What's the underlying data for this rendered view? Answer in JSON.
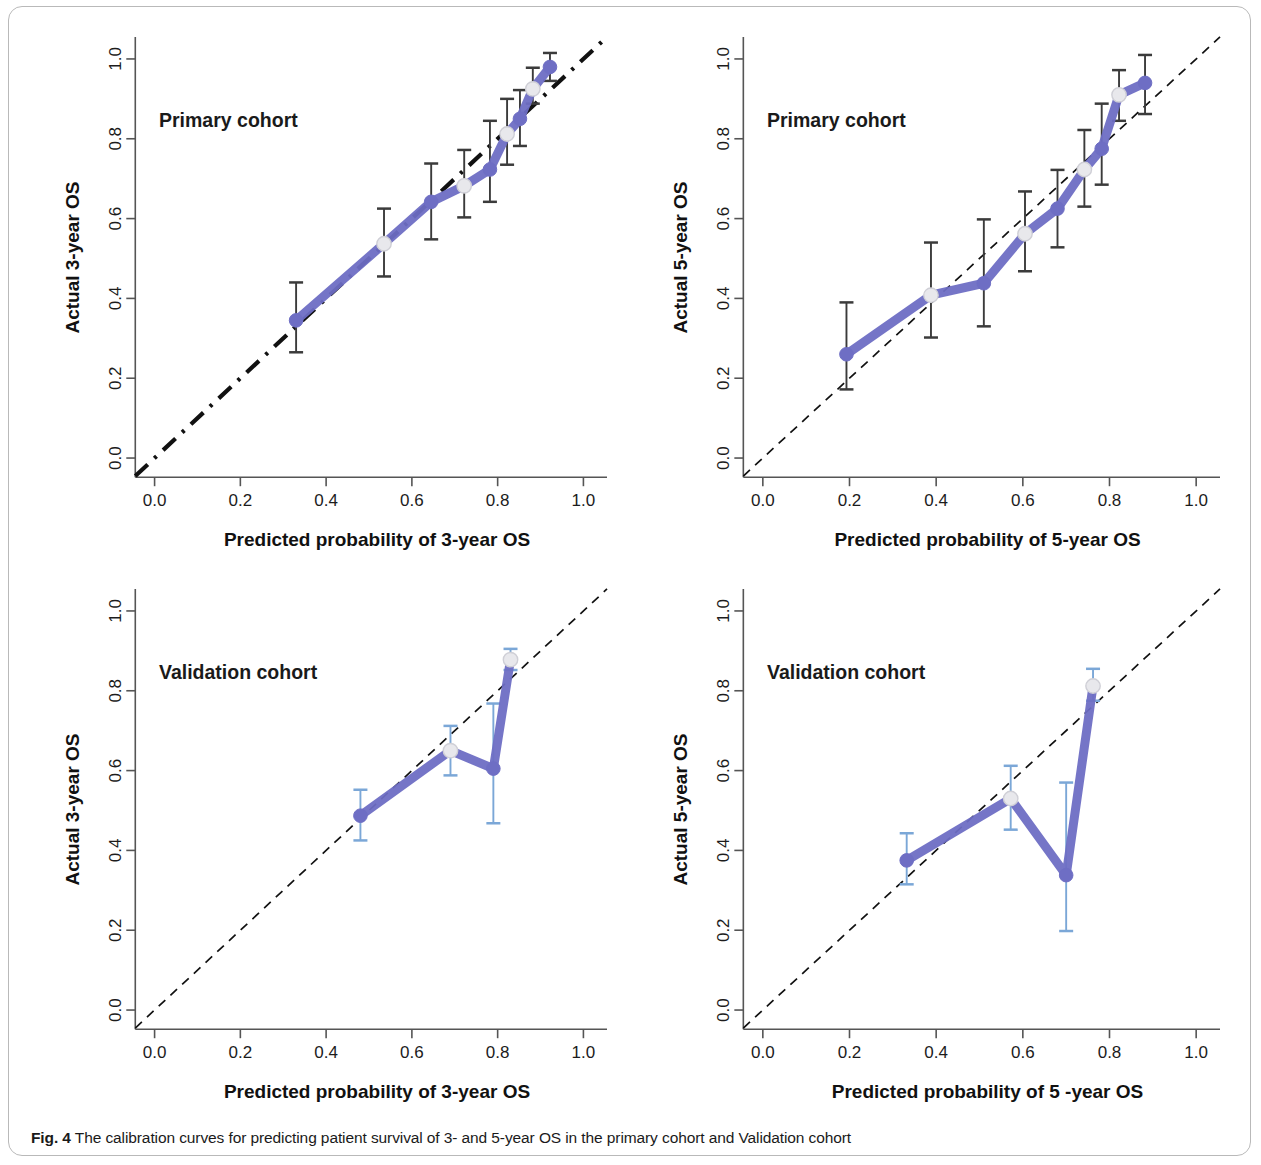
{
  "figure": {
    "caption_label": "Fig. 4",
    "caption_text": " The calibration curves for predicting patient survival of 3- and 5-year OS in the primary cohort and Validation cohort",
    "colors": {
      "curve_purple": "#6e6ec4",
      "errorbar_dark": "#3b3b3b",
      "errorbar_light": "#7ba7d7",
      "reference_line": "#111111",
      "open_marker_fill": "#e8e8ec",
      "axis": "#555555",
      "frame": "#b9b9b9"
    }
  },
  "chart_data": [
    {
      "id": "primary-3yr",
      "type": "line",
      "title": "Primary cohort",
      "xlabel": "Predicted probability of 3-year OS",
      "ylabel": "Actual 3-year OS",
      "xlim": [
        0.0,
        1.0
      ],
      "ylim": [
        0.0,
        1.0
      ],
      "xticks": [
        "0.0",
        "0.2",
        "0.4",
        "0.6",
        "0.8",
        "1.0"
      ],
      "yticks": [
        "0.0",
        "0.2",
        "0.4",
        "0.6",
        "0.8",
        "1.0"
      ],
      "xtick_values": [
        0.0,
        0.2,
        0.4,
        0.6,
        0.8,
        1.0
      ],
      "ytick_values": [
        0.0,
        0.2,
        0.4,
        0.6,
        0.8,
        1.0
      ],
      "grid": false,
      "legend": "none",
      "reference_line": {
        "style": "dash-dot",
        "width": "thick",
        "from": [
          0.0,
          0.0
        ],
        "to": [
          1.0,
          1.0
        ]
      },
      "errorbar_color": "dark",
      "points": [
        {
          "x": 0.33,
          "y": 0.345,
          "lo": 0.265,
          "hi": 0.44,
          "marker": "filled"
        },
        {
          "x": 0.535,
          "y": 0.537,
          "lo": 0.455,
          "hi": 0.625,
          "marker": "open"
        },
        {
          "x": 0.645,
          "y": 0.642,
          "lo": 0.548,
          "hi": 0.738,
          "marker": "filled"
        },
        {
          "x": 0.722,
          "y": 0.682,
          "lo": 0.603,
          "hi": 0.772,
          "marker": "open"
        },
        {
          "x": 0.782,
          "y": 0.723,
          "lo": 0.642,
          "hi": 0.845,
          "marker": "filled"
        },
        {
          "x": 0.822,
          "y": 0.812,
          "lo": 0.735,
          "hi": 0.9,
          "marker": "open"
        },
        {
          "x": 0.852,
          "y": 0.85,
          "lo": 0.782,
          "hi": 0.922,
          "marker": "filled"
        },
        {
          "x": 0.882,
          "y": 0.925,
          "lo": 0.888,
          "hi": 0.978,
          "marker": "open"
        },
        {
          "x": 0.922,
          "y": 0.98,
          "lo": 0.945,
          "hi": 1.015,
          "marker": "filled"
        }
      ]
    },
    {
      "id": "primary-5yr",
      "type": "line",
      "title": "Primary cohort",
      "xlabel": "Predicted probability of  5-year OS",
      "ylabel": "Actual 5-year OS",
      "xlim": [
        0.0,
        1.0
      ],
      "ylim": [
        0.0,
        1.0
      ],
      "xticks": [
        "0.0",
        "0.2",
        "0.4",
        "0.6",
        "0.8",
        "1.0"
      ],
      "yticks": [
        "0.0",
        "0.2",
        "0.4",
        "0.6",
        "0.8",
        "1.0"
      ],
      "xtick_values": [
        0.0,
        0.2,
        0.4,
        0.6,
        0.8,
        1.0
      ],
      "ytick_values": [
        0.0,
        0.2,
        0.4,
        0.6,
        0.8,
        1.0
      ],
      "grid": false,
      "legend": "none",
      "reference_line": {
        "style": "dash",
        "width": "thin",
        "from": [
          0.0,
          0.0
        ],
        "to": [
          1.0,
          1.0
        ]
      },
      "errorbar_color": "dark",
      "points": [
        {
          "x": 0.193,
          "y": 0.26,
          "lo": 0.172,
          "hi": 0.39,
          "marker": "filled"
        },
        {
          "x": 0.388,
          "y": 0.408,
          "lo": 0.302,
          "hi": 0.54,
          "marker": "open"
        },
        {
          "x": 0.51,
          "y": 0.438,
          "lo": 0.33,
          "hi": 0.598,
          "marker": "filled"
        },
        {
          "x": 0.605,
          "y": 0.562,
          "lo": 0.468,
          "hi": 0.668,
          "marker": "open"
        },
        {
          "x": 0.68,
          "y": 0.625,
          "lo": 0.528,
          "hi": 0.722,
          "marker": "filled"
        },
        {
          "x": 0.742,
          "y": 0.723,
          "lo": 0.63,
          "hi": 0.822,
          "marker": "open"
        },
        {
          "x": 0.782,
          "y": 0.775,
          "lo": 0.685,
          "hi": 0.888,
          "marker": "filled"
        },
        {
          "x": 0.822,
          "y": 0.91,
          "lo": 0.845,
          "hi": 0.972,
          "marker": "open"
        },
        {
          "x": 0.882,
          "y": 0.94,
          "lo": 0.862,
          "hi": 1.01,
          "marker": "filled"
        }
      ]
    },
    {
      "id": "validation-3yr",
      "type": "line",
      "title": "Validation cohort",
      "xlabel": "Predicted probability of 3-year OS",
      "ylabel": "Actual 3-year OS",
      "xlim": [
        0.0,
        1.0
      ],
      "ylim": [
        0.0,
        1.0
      ],
      "xticks": [
        "0.0",
        "0.2",
        "0.4",
        "0.6",
        "0.8",
        "1.0"
      ],
      "yticks": [
        "0.0",
        "0.2",
        "0.4",
        "0.6",
        "0.8",
        "1.0"
      ],
      "xtick_values": [
        0.0,
        0.2,
        0.4,
        0.6,
        0.8,
        1.0
      ],
      "ytick_values": [
        0.0,
        0.2,
        0.4,
        0.6,
        0.8,
        1.0
      ],
      "grid": false,
      "legend": "none",
      "reference_line": {
        "style": "dash",
        "width": "thin",
        "from": [
          0.0,
          0.0
        ],
        "to": [
          1.0,
          1.0
        ]
      },
      "errorbar_color": "light",
      "points": [
        {
          "x": 0.48,
          "y": 0.487,
          "lo": 0.425,
          "hi": 0.552,
          "marker": "filled"
        },
        {
          "x": 0.69,
          "y": 0.65,
          "lo": 0.588,
          "hi": 0.712,
          "marker": "open"
        },
        {
          "x": 0.79,
          "y": 0.605,
          "lo": 0.468,
          "hi": 0.768,
          "marker": "filled"
        },
        {
          "x": 0.83,
          "y": 0.878,
          "lo": 0.852,
          "hi": 0.905,
          "marker": "open"
        }
      ]
    },
    {
      "id": "validation-5yr",
      "type": "line",
      "title": "Validation cohort",
      "xlabel": "Predicted probability of 5 -year OS",
      "ylabel": "Actual 5-year OS",
      "xlim": [
        0.0,
        1.0
      ],
      "ylim": [
        0.0,
        1.0
      ],
      "xticks": [
        "0.0",
        "0.2",
        "0.4",
        "0.6",
        "0.8",
        "1.0"
      ],
      "yticks": [
        "0.0",
        "0.2",
        "0.4",
        "0.6",
        "0.8",
        "1.0"
      ],
      "xtick_values": [
        0.0,
        0.2,
        0.4,
        0.6,
        0.8,
        1.0
      ],
      "ytick_values": [
        0.0,
        0.2,
        0.4,
        0.6,
        0.8,
        1.0
      ],
      "grid": false,
      "legend": "none",
      "reference_line": {
        "style": "dash",
        "width": "thin",
        "from": [
          0.0,
          0.0
        ],
        "to": [
          1.0,
          1.0
        ]
      },
      "errorbar_color": "light",
      "points": [
        {
          "x": 0.332,
          "y": 0.375,
          "lo": 0.315,
          "hi": 0.443,
          "marker": "filled"
        },
        {
          "x": 0.572,
          "y": 0.53,
          "lo": 0.452,
          "hi": 0.612,
          "marker": "open"
        },
        {
          "x": 0.7,
          "y": 0.338,
          "lo": 0.198,
          "hi": 0.57,
          "marker": "filled"
        },
        {
          "x": 0.762,
          "y": 0.812,
          "lo": 0.775,
          "hi": 0.855,
          "marker": "open"
        }
      ]
    }
  ]
}
